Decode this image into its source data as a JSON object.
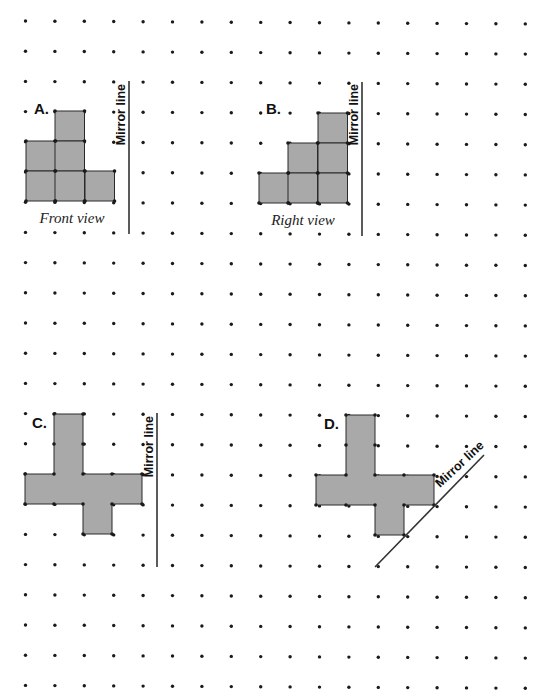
{
  "colors": {
    "background": "#ffffff",
    "dot": "#1a1a1a",
    "shape_fill": "#a9a9a9",
    "shape_stroke": "#2a2a2a",
    "mirror_line": "#333333"
  },
  "grid": {
    "columns": 18,
    "rows": 23,
    "x0": 25.5,
    "y0": 21,
    "dx": 29.4,
    "dy": 30.2,
    "dot_radius": 1.7
  },
  "panels": [
    {
      "id": "A",
      "label": "A.",
      "label_pos": [
        34,
        114
      ],
      "caption": "Front view",
      "caption_pos": [
        72,
        223
      ],
      "mirror_label": "Mirror line",
      "mirror_line": {
        "x1": 129,
        "y1": 81,
        "x2": 129,
        "y2": 234
      },
      "mirror_label_pos": [
        125,
        84
      ],
      "mirror_label_rotate": -90,
      "cells": [
        [
          55,
          111
        ],
        [
          26,
          141
        ],
        [
          55,
          141
        ],
        [
          26,
          171
        ],
        [
          55,
          171
        ],
        [
          85,
          171
        ]
      ],
      "cell_size": [
        29.5,
        30
      ]
    },
    {
      "id": "B",
      "label": "B.",
      "label_pos": [
        266,
        114
      ],
      "caption": "Right view",
      "caption_pos": [
        303,
        225
      ],
      "mirror_label": "Mirror line",
      "mirror_line": {
        "x1": 362,
        "y1": 82,
        "x2": 362,
        "y2": 236
      },
      "mirror_label_pos": [
        358,
        84
      ],
      "mirror_label_rotate": -90,
      "cells": [
        [
          318,
          113
        ],
        [
          288,
          143
        ],
        [
          318,
          143
        ],
        [
          259,
          173
        ],
        [
          288,
          173
        ],
        [
          318,
          173
        ]
      ],
      "cell_size": [
        29.5,
        30
      ]
    },
    {
      "id": "C",
      "label": "C.",
      "label_pos": [
        32,
        428
      ],
      "caption": "",
      "mirror_label": "Mirror line",
      "mirror_line": {
        "x1": 157,
        "y1": 413,
        "x2": 157,
        "y2": 567
      },
      "mirror_label_pos": [
        153,
        416
      ],
      "mirror_label_rotate": -90,
      "polygon": [
        [
          54,
          414
        ],
        [
          83,
          414
        ],
        [
          83,
          474
        ],
        [
          142,
          474
        ],
        [
          142,
          504
        ],
        [
          112,
          504
        ],
        [
          112,
          534
        ],
        [
          83,
          534
        ],
        [
          83,
          504
        ],
        [
          25,
          504
        ],
        [
          25,
          474
        ],
        [
          54,
          474
        ]
      ],
      "vertices": [
        [
          54,
          414
        ],
        [
          83,
          414
        ],
        [
          54,
          444
        ],
        [
          83,
          444
        ],
        [
          25,
          474
        ],
        [
          54,
          474
        ],
        [
          83,
          474
        ],
        [
          112,
          474
        ],
        [
          142,
          474
        ],
        [
          25,
          504
        ],
        [
          54,
          504
        ],
        [
          83,
          504
        ],
        [
          112,
          504
        ],
        [
          142,
          504
        ],
        [
          83,
          534
        ],
        [
          112,
          534
        ]
      ]
    },
    {
      "id": "D",
      "label": "D.",
      "label_pos": [
        324,
        429
      ],
      "caption": "",
      "mirror_label": "Mirror line",
      "mirror_line": {
        "x1": 375,
        "y1": 567,
        "x2": 484,
        "y2": 455
      },
      "mirror_label_pos": [
        440,
        488
      ],
      "mirror_label_rotate": -43,
      "polygon": [
        [
          346,
          415
        ],
        [
          375,
          415
        ],
        [
          375,
          475
        ],
        [
          434,
          475
        ],
        [
          434,
          505
        ],
        [
          404,
          505
        ],
        [
          404,
          535
        ],
        [
          375,
          535
        ],
        [
          375,
          505
        ],
        [
          316,
          505
        ],
        [
          316,
          475
        ],
        [
          346,
          475
        ]
      ],
      "vertices": [
        [
          346,
          415
        ],
        [
          375,
          415
        ],
        [
          346,
          445
        ],
        [
          375,
          445
        ],
        [
          316,
          475
        ],
        [
          346,
          475
        ],
        [
          375,
          475
        ],
        [
          404,
          475
        ],
        [
          434,
          475
        ],
        [
          316,
          505
        ],
        [
          346,
          505
        ],
        [
          375,
          505
        ],
        [
          404,
          505
        ],
        [
          434,
          505
        ],
        [
          375,
          535
        ],
        [
          404,
          535
        ]
      ]
    }
  ]
}
